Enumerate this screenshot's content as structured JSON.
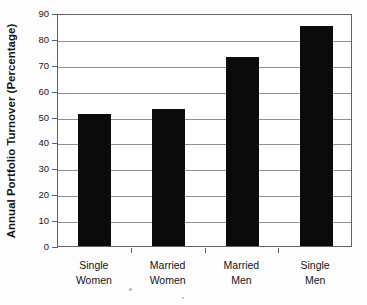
{
  "chart_data": {
    "type": "bar",
    "title": "",
    "xlabel": "",
    "ylabel": "Annual Portfolio Turnover (Percentage)",
    "categories": [
      "Single Women",
      "Married Women",
      "Married Men",
      "Single Men"
    ],
    "category_lines": [
      [
        "Single",
        "Women"
      ],
      [
        "Married",
        "Women"
      ],
      [
        "Married",
        "Men"
      ],
      [
        "Single",
        "Men"
      ]
    ],
    "values": [
      51,
      53,
      73,
      85
    ],
    "ylim": [
      0,
      90
    ],
    "ytick_step": 10,
    "yticks": [
      0,
      10,
      20,
      30,
      40,
      50,
      60,
      70,
      80,
      90
    ],
    "ytick_labels": [
      "0",
      "10",
      "20",
      "30",
      "40",
      "50",
      "60",
      "70",
      "80",
      "90"
    ],
    "grid": true,
    "legend": "none",
    "bar_color": "#0b0b0c",
    "grid_color": "#8d9094",
    "frame_color": "#5f6164",
    "background_color": "#ffffff"
  }
}
